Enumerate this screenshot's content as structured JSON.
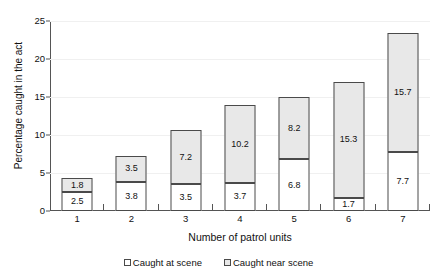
{
  "chart_data": {
    "type": "bar",
    "subtype": "stacked-bar",
    "title": "",
    "xlabel": "Number of patrol units",
    "ylabel": "Percentage caught in the act",
    "categories": [
      "1",
      "2",
      "3",
      "4",
      "5",
      "6",
      "7"
    ],
    "ylim": [
      0,
      25
    ],
    "yticks": [
      0,
      5,
      10,
      15,
      20,
      25
    ],
    "yticklabels": [
      "0",
      "5",
      "10",
      "15",
      "20",
      "25"
    ],
    "grid": true,
    "legend_position": "bottom",
    "series": [
      {
        "name": "Caught at scene",
        "color": "#ffffff",
        "values": [
          2.5,
          3.8,
          3.5,
          3.7,
          6.8,
          1.7,
          7.7
        ],
        "labels": [
          "2.5",
          "3.8",
          "3.5",
          "3.7",
          "6.8",
          "1.7",
          "7.7"
        ]
      },
      {
        "name": "Caught near scene",
        "color": "#e8e8e8",
        "values": [
          1.8,
          3.5,
          7.2,
          10.2,
          8.2,
          15.3,
          15.7
        ],
        "labels": [
          "1.8",
          "3.5",
          "7.2",
          "10.2",
          "8.2",
          "15.3",
          "15.7"
        ]
      }
    ],
    "totals": [
      4.3,
      7.3,
      10.7,
      13.9,
      15.0,
      17.0,
      23.4
    ]
  },
  "legend": {
    "items": [
      {
        "label": "Caught at scene"
      },
      {
        "label": "Caught near scene"
      }
    ]
  },
  "colors": {
    "at_scene": "#ffffff",
    "near_scene": "#e8e8e8",
    "outline": "#4a4a4a",
    "axis": "#555555",
    "gridline": "#f0f0f0"
  }
}
